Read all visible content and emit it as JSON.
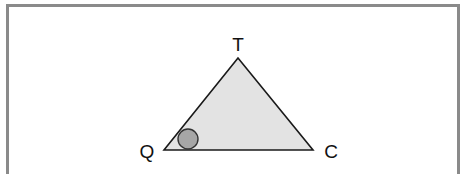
{
  "diagram": {
    "type": "triangle",
    "frame": {
      "border_color": "#8a8a8a"
    },
    "triangle": {
      "fill": "#e3e3e3",
      "stroke": "#1a1a1a",
      "vertices": {
        "T": {
          "x": 238,
          "y": 58
        },
        "Q": {
          "x": 164,
          "y": 150
        },
        "C": {
          "x": 313,
          "y": 150
        }
      }
    },
    "labels": {
      "T": "T",
      "Q": "Q",
      "C": "C"
    },
    "angle_marker": {
      "vertex": "Q",
      "shape": "filled-circle",
      "fill": "#a6a6a6",
      "stroke": "#333333",
      "cx": 188,
      "cy": 139,
      "r": 10
    }
  }
}
